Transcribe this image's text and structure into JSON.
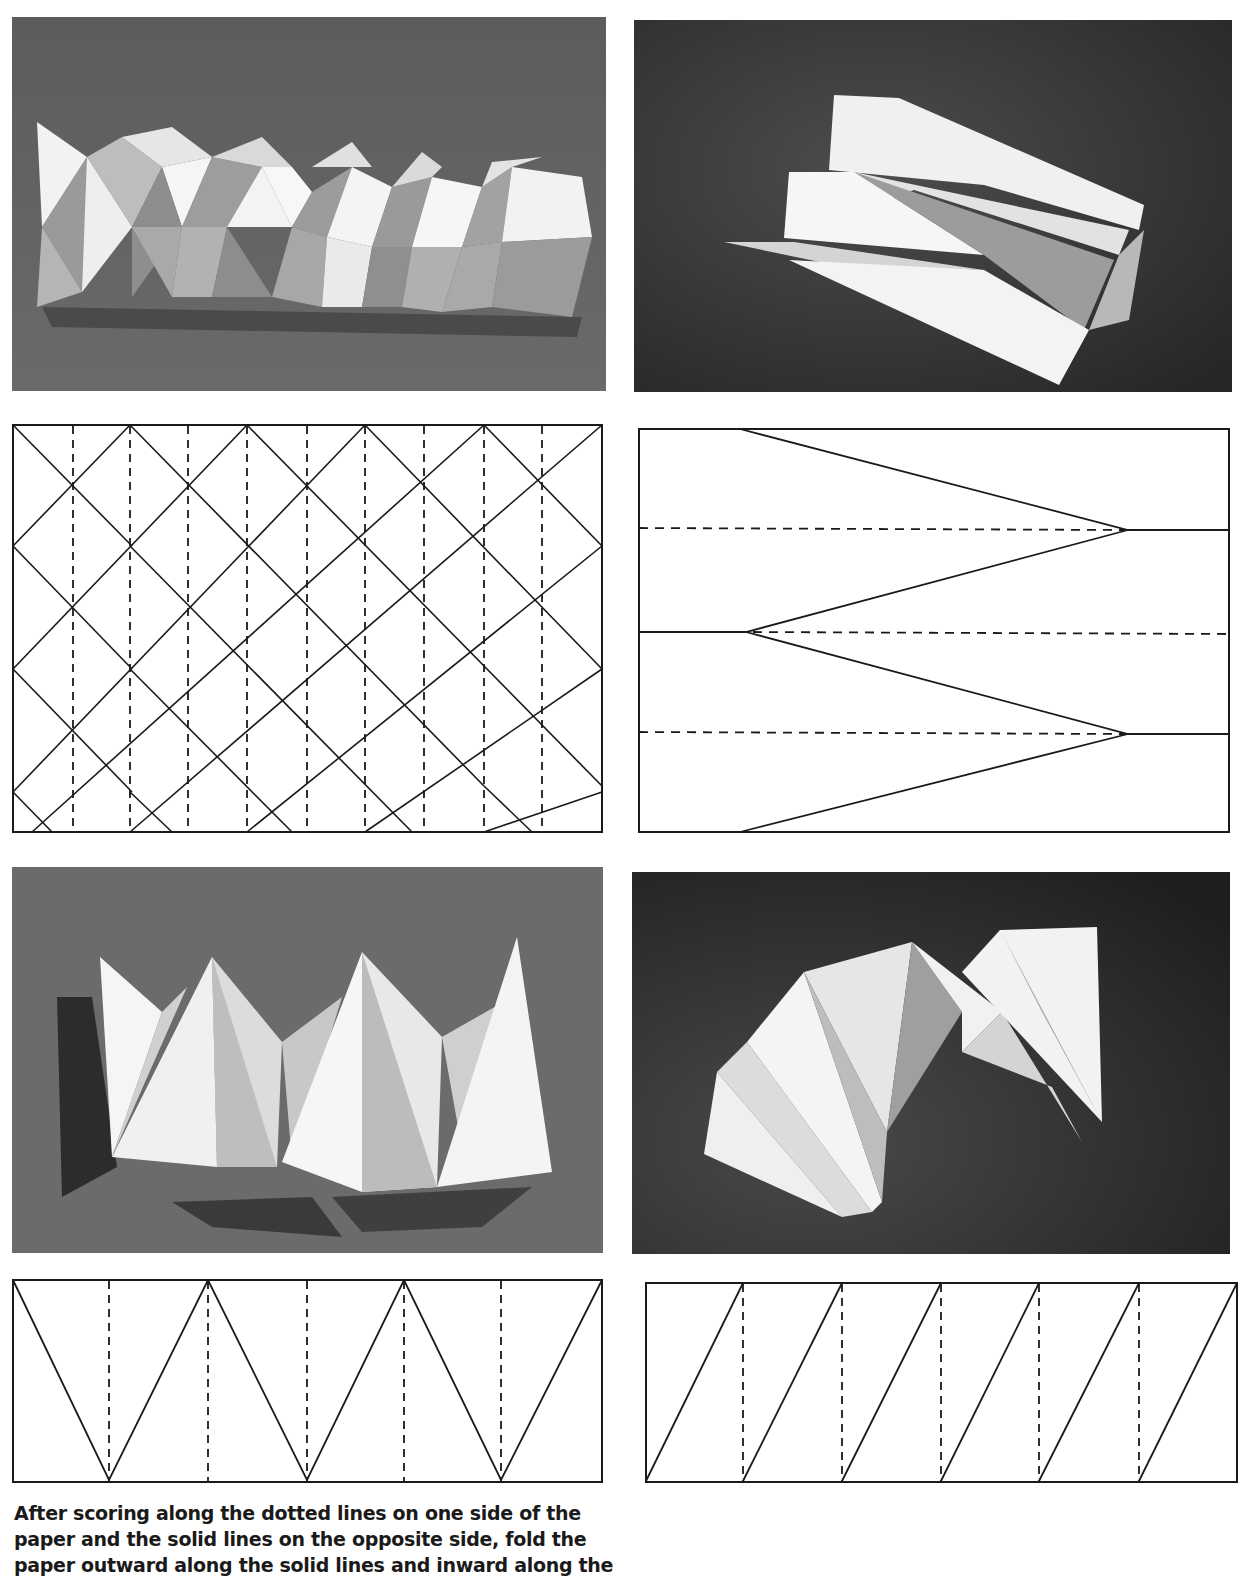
{
  "figures": [
    {
      "id": "fig1",
      "photo_label": "Folded paper model: diamond-pattern column with alternating pyramidal facets",
      "diagram": {
        "type": "diamond-grid",
        "description": "Rectangle with diagonal solid crease lattice and 9 vertical dotted lines",
        "solid_lines": "diagonals",
        "dotted_lines": "vertical",
        "dotted_count": 9
      }
    },
    {
      "id": "fig2",
      "photo_label": "Folded paper model: pointed stepped pleat form",
      "diagram": {
        "type": "chevron",
        "description": "Rectangle with zigzag solid lines converging to points and 3 horizontal dotted lines",
        "dotted_count": 3
      }
    },
    {
      "id": "fig3",
      "photo_label": "Folded paper model: row of triangular peaks",
      "diagram": {
        "type": "zigzag",
        "description": "Rectangle with solid W zigzag and 5 vertical dotted lines",
        "dotted_count": 5
      }
    },
    {
      "id": "fig4",
      "photo_label": "Folded paper model: curved fan arch",
      "diagram": {
        "type": "slanted",
        "description": "Rectangle with 6 parallel slanted solid lines and 5 vertical dotted lines",
        "dotted_count": 5
      }
    }
  ],
  "caption": {
    "line1": "After scoring along the dotted lines on one side of the",
    "line2": "paper and the solid lines on the opposite side, fold the",
    "line3": "paper outward along the solid lines and inward along the"
  },
  "colors": {
    "ink": "#1a1a1a",
    "paper": "#ffffff",
    "photo_bg_light": "#6e6e6e",
    "photo_bg_dark": "#2a2a2a"
  }
}
